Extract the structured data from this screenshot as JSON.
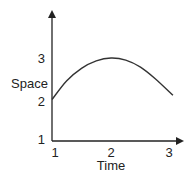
{
  "chart_data": {
    "type": "line",
    "title": "",
    "xlabel": "Time",
    "ylabel": "Space",
    "x_ticks": [
      "1",
      "2",
      "3"
    ],
    "y_ticks": [
      "1",
      "2",
      "3"
    ],
    "xlim": [
      1,
      3.2
    ],
    "ylim": [
      1,
      3.8
    ],
    "grid": false,
    "legend": null,
    "series": [
      {
        "name": "curve",
        "x": [
          1.0,
          1.25,
          1.5,
          1.75,
          2.0,
          2.25,
          2.5,
          2.75,
          3.05
        ],
        "y": [
          2.0,
          2.45,
          2.75,
          2.93,
          3.0,
          2.95,
          2.78,
          2.5,
          2.1
        ]
      }
    ]
  },
  "colors": {
    "axis": "#222222",
    "curve": "#333333"
  }
}
